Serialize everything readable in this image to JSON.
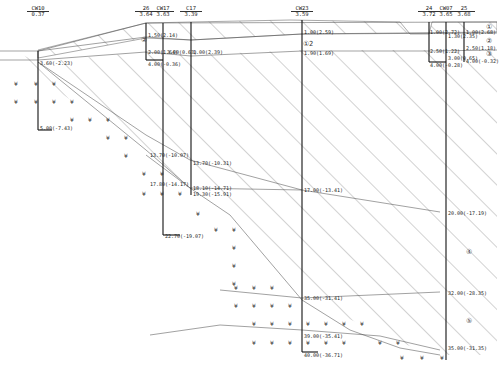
{
  "boreholes": [
    {
      "name": "CW10",
      "elev": "0.37",
      "x": 38
    },
    {
      "name": "26",
      "elev": "3.64",
      "x": 146
    },
    {
      "name": "CW17",
      "elev": "3.63",
      "x": 163
    },
    {
      "name": "C17",
      "elev": "3.39",
      "x": 191
    },
    {
      "name": "CW23",
      "elev": "3.59",
      "x": 302
    },
    {
      "name": "24",
      "elev": "3.72",
      "x": 429
    },
    {
      "name": "CW07",
      "elev": "3.65",
      "x": 446
    },
    {
      "name": "25",
      "elev": "3.68",
      "x": 464
    }
  ],
  "layer_labels": [
    {
      "id": "layer-2",
      "text": "②",
      "x": 141,
      "y": 40
    },
    {
      "id": "layer-1-2",
      "text": "①2",
      "x": 303,
      "y": 43
    },
    {
      "id": "layer-1-right-top",
      "text": "①",
      "x": 486,
      "y": 27
    },
    {
      "id": "layer-2-right",
      "text": "②",
      "x": 486,
      "y": 41
    },
    {
      "id": "layer-3-right",
      "text": "③",
      "x": 486,
      "y": 54
    },
    {
      "id": "layer-4",
      "text": "④",
      "x": 466,
      "y": 252
    },
    {
      "id": "layer-5",
      "text": "⑤",
      "x": 466,
      "y": 321
    }
  ],
  "depth_labels": [
    {
      "text": "3.60(-2.23)",
      "x": 40,
      "y": 63
    },
    {
      "text": "5.00(-7.43)",
      "x": 40,
      "y": 128
    },
    {
      "text": "1.50(2.14)",
      "x": 148,
      "y": 35
    },
    {
      "text": "2.00(1.64)",
      "x": 148,
      "y": 52
    },
    {
      "text": "4.00(-0.36)",
      "x": 148,
      "y": 60
    },
    {
      "text": "3.00(0.63)",
      "x": 167,
      "y": 51
    },
    {
      "text": "1.00(2.39)",
      "x": 193,
      "y": 52
    },
    {
      "text": "13.70(-10.07)",
      "x": 150,
      "y": 155
    },
    {
      "text": "17.80(-14.17)",
      "x": 150,
      "y": 184
    },
    {
      "text": "13.70(-10.31)",
      "x": 193,
      "y": 163
    },
    {
      "text": "18.10(-14.71)",
      "x": 193,
      "y": 188
    },
    {
      "text": "19.30(-15.91)",
      "x": 193,
      "y": 193
    },
    {
      "text": "22.70(-19.07)",
      "x": 165,
      "y": 233
    },
    {
      "text": "1.00(2.59)",
      "x": 304,
      "y": 32
    },
    {
      "text": "1.90(1.69)",
      "x": 304,
      "y": 51
    },
    {
      "text": "17.00(-13.41)",
      "x": 304,
      "y": 190
    },
    {
      "text": "35.00(-31.41)",
      "x": 304,
      "y": 298
    },
    {
      "text": "39.00(-35.41)",
      "x": 304,
      "y": 336
    },
    {
      "text": "40.00(-36.71)",
      "x": 304,
      "y": 350
    },
    {
      "text": "1.00(2.72)",
      "x": 430,
      "y": 32
    },
    {
      "text": "1.30(2.35)",
      "x": 448,
      "y": 35
    },
    {
      "text": "2.50(1.22)",
      "x": 430,
      "y": 51
    },
    {
      "text": "4.00(-0.28)",
      "x": 430,
      "y": 60
    },
    {
      "text": "3.00(0.65)",
      "x": 448,
      "y": 57
    },
    {
      "text": "1.00(2.68)",
      "x": 466,
      "y": 32
    },
    {
      "text": "2.50(1.18)",
      "x": 466,
      "y": 48
    },
    {
      "text": "4.00(-0.32)",
      "x": 466,
      "y": 60
    },
    {
      "text": "20.00(-17.19)",
      "x": 448,
      "y": 213
    },
    {
      "text": "32.00(-28.35)",
      "x": 448,
      "y": 293
    },
    {
      "text": "35.00(-31.35)",
      "x": 448,
      "y": 348
    }
  ]
}
